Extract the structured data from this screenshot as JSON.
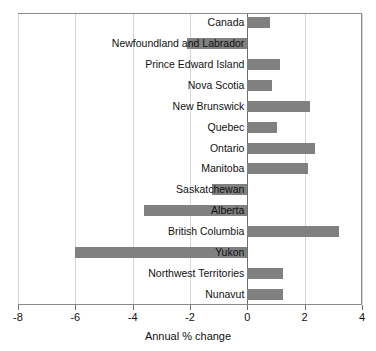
{
  "chart_data": {
    "type": "bar",
    "orientation": "horizontal",
    "title": "",
    "xlabel": "Annual % change",
    "ylabel": "",
    "xlim": [
      -8,
      4
    ],
    "xticks": [
      -8,
      -6,
      -4,
      -2,
      0,
      2,
      4
    ],
    "xtick_labels": [
      "-8",
      "-6",
      "-4",
      "-2",
      "0",
      "2",
      "4"
    ],
    "grid": true,
    "legend": null,
    "bar_color": "#808080",
    "categories": [
      "Canada",
      "Newfoundland and Labrador",
      "Prince Edward Island",
      "Nova Scotia",
      "New Brunswick",
      "Quebec",
      "Ontario",
      "Manitoba",
      "Saskatchewan",
      "Alberta",
      "British Columbia",
      "Yukon",
      "Northwest Territories",
      "Nunavut"
    ],
    "values": [
      0.8,
      -2.1,
      1.15,
      0.85,
      2.2,
      1.05,
      2.35,
      2.1,
      -1.25,
      -3.6,
      3.2,
      -6.0,
      1.25,
      1.25
    ]
  }
}
